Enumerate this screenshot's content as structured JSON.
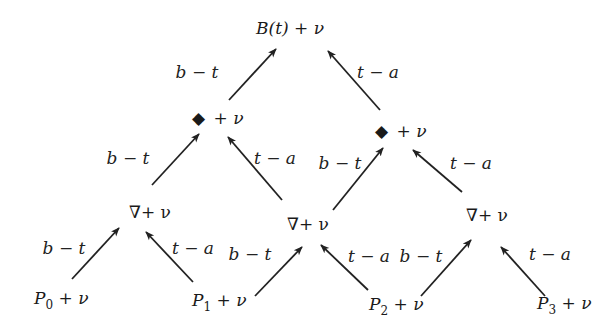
{
  "nodes": {
    "top": {
      "label": "B(t) + ν"
    },
    "diamond_left": {
      "label": "+ ν",
      "symbol": "◆"
    },
    "diamond_right": {
      "label": "+ ν",
      "symbol": "◆"
    },
    "nabla_left": {
      "label": "∇+ ν"
    },
    "nabla_mid": {
      "label": "∇+ ν"
    },
    "nabla_right": {
      "label": "∇+ ν"
    },
    "p0": {
      "base": "P",
      "sub": "0",
      "rest": " + ν"
    },
    "p1": {
      "base": "P",
      "sub": "1",
      "rest": " + ν"
    },
    "p2": {
      "base": "P",
      "sub": "2",
      "rest": " + ν"
    },
    "p3": {
      "base": "P",
      "sub": "3",
      "rest": " + ν"
    }
  },
  "edges": [
    {
      "id": "dl-top",
      "label": "b − t"
    },
    {
      "id": "dr-top",
      "label": "t − a"
    },
    {
      "id": "nl-dl",
      "label": "b − t"
    },
    {
      "id": "nm-dl",
      "label": "t − a"
    },
    {
      "id": "nm-dr",
      "label": "b − t"
    },
    {
      "id": "nr-dr",
      "label": "t − a"
    },
    {
      "id": "p0-nl",
      "label": "b − t"
    },
    {
      "id": "p1-nl",
      "label": "t − a"
    },
    {
      "id": "p1-nm",
      "label": "b − t"
    },
    {
      "id": "p2-nm",
      "label": "t − a"
    },
    {
      "id": "p2-nr",
      "label": "b − t"
    },
    {
      "id": "p3-nr",
      "label": "t − a"
    }
  ]
}
